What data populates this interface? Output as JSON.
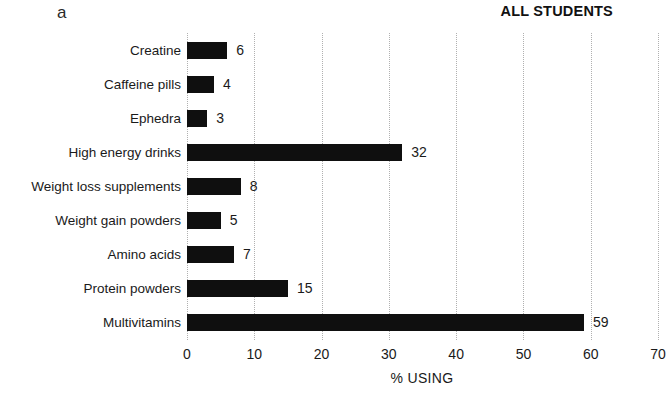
{
  "panel_label": "a",
  "title": "ALL STUDENTS",
  "chart_data": {
    "type": "bar",
    "orientation": "horizontal",
    "title": "ALL STUDENTS",
    "categories": [
      "Creatine",
      "Caffeine pills",
      "Ephedra",
      "High energy drinks",
      "Weight loss supplements",
      "Weight gain powders",
      "Amino acids",
      "Protein powders",
      "Multivitamins"
    ],
    "values": [
      6,
      4,
      3,
      32,
      8,
      5,
      7,
      15,
      59
    ],
    "xlabel": "% USING",
    "xlim": [
      0,
      70
    ],
    "xticks": [
      0,
      10,
      20,
      30,
      40,
      50,
      60,
      70
    ],
    "grid": "vertical-dotted",
    "legend": "none",
    "bar_color": "#0f0f0f",
    "gridline_color": "#b0b0b0",
    "background_color": "#ffffff",
    "text_color": "#1a1a1a"
  }
}
